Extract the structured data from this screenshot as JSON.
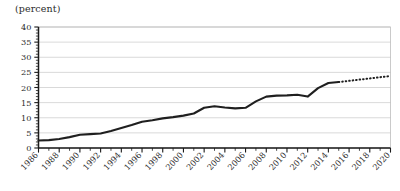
{
  "chart_data": {
    "type": "line",
    "title": "(percent)",
    "ylabel": "(percent)",
    "xlabel": "",
    "ylim": [
      0,
      40
    ],
    "xlim": [
      1986,
      2020
    ],
    "ytick_step": 5,
    "ytick_minor_step": 1,
    "xtick_step": 2,
    "xtick_minor_step": 1,
    "grid": true,
    "legend": false,
    "yticks": [
      "0",
      "5",
      "10",
      "15",
      "20",
      "25",
      "30",
      "35",
      "40"
    ],
    "xticks": [
      "1986",
      "1988",
      "1990",
      "1992",
      "1994",
      "1996",
      "1998",
      "2000",
      "2002",
      "2004",
      "2006",
      "2008",
      "2010",
      "2012",
      "2014",
      "2016",
      "2018",
      "2020"
    ],
    "series": [
      {
        "name": "actual",
        "style": "solid",
        "x": [
          1986,
          1987,
          1988,
          1989,
          1990,
          1991,
          1992,
          1993,
          1994,
          1995,
          1996,
          1997,
          1998,
          1999,
          2000,
          2001,
          2002,
          2003,
          2004,
          2005,
          2006,
          2007,
          2008,
          2009,
          2010,
          2011,
          2012,
          2013,
          2014,
          2015
        ],
        "values": [
          2.5,
          2.6,
          3.0,
          3.6,
          4.4,
          4.6,
          4.8,
          5.6,
          6.6,
          7.6,
          8.7,
          9.2,
          9.8,
          10.2,
          10.7,
          11.4,
          13.3,
          13.8,
          13.4,
          13.1,
          13.3,
          15.4,
          17.0,
          17.3,
          17.4,
          17.6,
          17.0,
          19.8,
          21.5,
          21.8
        ]
      },
      {
        "name": "projection",
        "style": "dotted",
        "x": [
          2015,
          2016,
          2017,
          2018,
          2019,
          2020
        ],
        "values": [
          21.8,
          22.2,
          22.6,
          23.0,
          23.4,
          23.8
        ]
      }
    ]
  },
  "accent_color": "#1f1f1f",
  "grid_color": "#c8c8c8",
  "background_color": "#ffffff"
}
